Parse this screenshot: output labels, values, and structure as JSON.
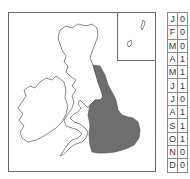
{
  "map": {
    "region": "British Isles",
    "shaded_region": "Eastern and southern England",
    "shade_color": "#6e6e6e",
    "outline_color": "#555555",
    "inset": "Shetland / northern isles"
  },
  "calendar": {
    "rows": [
      {
        "month": "J",
        "value": "0"
      },
      {
        "month": "F",
        "value": "0"
      },
      {
        "month": "M",
        "value": "0"
      },
      {
        "month": "A",
        "value": "1"
      },
      {
        "month": "M",
        "value": "1"
      },
      {
        "month": "J",
        "value": "1"
      },
      {
        "month": "J",
        "value": "0"
      },
      {
        "month": "A",
        "value": "1"
      },
      {
        "month": "S",
        "value": "1"
      },
      {
        "month": "O",
        "value": "1"
      },
      {
        "month": "N",
        "value": "0"
      },
      {
        "month": "D",
        "value": "0"
      }
    ]
  }
}
